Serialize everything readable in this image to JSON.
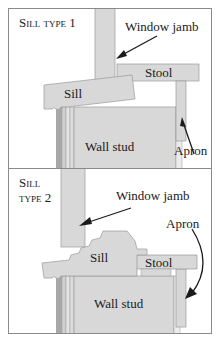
{
  "panels": [
    {
      "title": "Sill type 1",
      "labels": {
        "window_jamb": "Window jamb",
        "stool": "Stool",
        "sill": "Sill",
        "wall_stud": "Wall stud",
        "apron": "Apron"
      }
    },
    {
      "title_line1": "Sill",
      "title_line2": "type 2",
      "labels": {
        "window_jamb": "Window jamb",
        "apron": "Apron",
        "sill": "Sill",
        "stool": "Stool",
        "wall_stud": "Wall stud"
      }
    }
  ],
  "colors": {
    "wood_fill": "#d8d8d8",
    "wood_edge": "#9a9a9a",
    "stud_dark": "#a8a8a8",
    "stud_light": "#e8e8e8",
    "border": "#8a8a8a",
    "text": "#1a1a1a"
  }
}
